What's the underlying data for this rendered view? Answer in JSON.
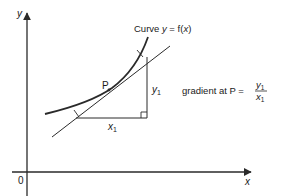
{
  "diagram": {
    "axes": {
      "x_label": "x",
      "y_label": "y",
      "origin_label": "0"
    },
    "curve": {
      "label_prefix": "Curve ",
      "label_var": "y",
      "label_eq": " = f(",
      "label_arg": "x",
      "label_close": ")"
    },
    "point": {
      "label": "P"
    },
    "triangle": {
      "run_label": "x",
      "run_subscript": "1",
      "rise_label": "y",
      "rise_subscript": "1"
    },
    "formula": {
      "text": "gradient at P =",
      "numerator": "y",
      "numerator_subscript": "1",
      "denominator": "x",
      "denominator_subscript": "1"
    }
  }
}
